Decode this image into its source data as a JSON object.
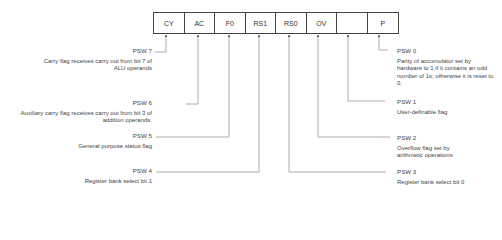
{
  "register": {
    "bits": [
      "CY",
      "AC",
      "F0",
      "RS1",
      "RS0",
      "OV",
      "",
      "P"
    ]
  },
  "annotations": {
    "psw7": {
      "name": "PSW 7",
      "desc": "Carry flag receives carry out from bit 7 of ALU operands"
    },
    "psw6": {
      "name": "PSW 6",
      "desc": "Auxiliary carry flag receives carry out from bit 3 of addition operands."
    },
    "psw5": {
      "name": "PSW 5",
      "desc": "General purpose status flag"
    },
    "psw4": {
      "name": "PSW 4",
      "desc": "Register bank select bit 1"
    },
    "psw0": {
      "name": "PSW 0",
      "desc": "Parity of accumulator set by hardware to 1 if it contains an odd number of 1s; otherwise it is reset to 0."
    },
    "psw1": {
      "name": "PSW 1",
      "desc": "User-definable flag"
    },
    "psw2": {
      "name": "PSW 2",
      "desc": "Overflow flag set by arithmetic operations"
    },
    "psw3": {
      "name": "PSW 3",
      "desc": "Register bank select bit 0"
    }
  }
}
